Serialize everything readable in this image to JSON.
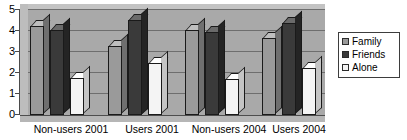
{
  "chart_data": {
    "type": "bar",
    "title": "",
    "subtitle": "",
    "xlabel": "",
    "ylabel": "",
    "ylim": [
      0,
      5
    ],
    "yticks": [
      0,
      1,
      2,
      3,
      4,
      5
    ],
    "ytick_labels": [
      "0",
      "1",
      "2",
      "3",
      "4",
      "5"
    ],
    "grid": true,
    "three_d": true,
    "legend_position": "right",
    "categories": [
      "Non-users 2001",
      "Users 2001",
      "Non-users 2004",
      "Users 2004"
    ],
    "series": [
      {
        "name": "Family",
        "color": "#9a9a9a",
        "values": [
          4.2,
          3.25,
          4.0,
          3.6
        ]
      },
      {
        "name": "Friends",
        "color": "#3a3a3a",
        "values": [
          4.0,
          4.5,
          3.9,
          4.35
        ]
      },
      {
        "name": "Alone",
        "color": "#f4f4f4",
        "values": [
          1.7,
          2.45,
          1.65,
          2.2
        ]
      }
    ]
  },
  "axis": {
    "y_tick_labels": [
      "5",
      "4",
      "3",
      "2",
      "1",
      "0"
    ]
  },
  "categories": [
    {
      "label": "Non-users 2001"
    },
    {
      "label": "Users 2001"
    },
    {
      "label": "Non-users 2004"
    },
    {
      "label": "Users 2004"
    }
  ],
  "legend": {
    "items": [
      {
        "label": "Family",
        "swatch": "#9a9a9a"
      },
      {
        "label": "Friends",
        "swatch": "#3a3a3a"
      },
      {
        "label": "Alone",
        "swatch": "#f4f4f4"
      }
    ]
  }
}
